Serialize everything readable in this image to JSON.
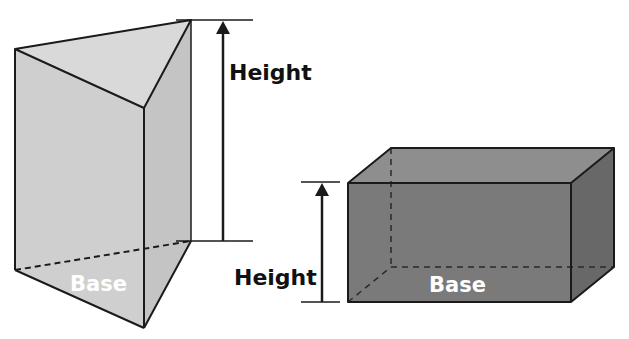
{
  "diagram": {
    "colors": {
      "background": "#ffffff",
      "stroke": "#1a1a1a",
      "prism_front": "#cfcfcf",
      "prism_top": "#d9d9d9",
      "prism_side": "#c4c4c4",
      "box_front": "#7a7a7a",
      "box_top": "#8e8e8e",
      "box_side": "#686868",
      "height_label": "#111111",
      "base_label": "#ffffff"
    },
    "triangular_prism": {
      "name": "Triangular prism",
      "height_label": "Height",
      "base_label": "Base"
    },
    "rectangular_prism": {
      "name": "Rectangular prism",
      "height_label": "Height",
      "base_label": "Base"
    }
  }
}
